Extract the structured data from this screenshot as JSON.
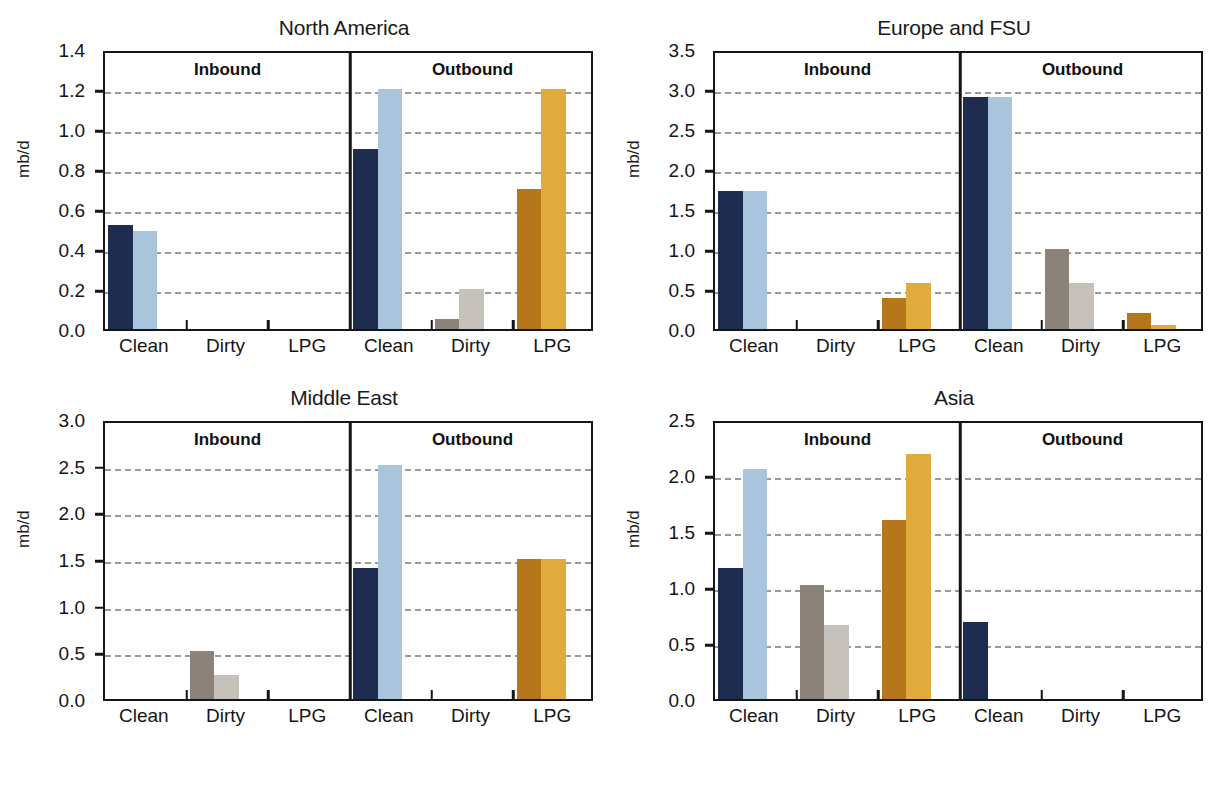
{
  "figure": {
    "cut_top_text": "",
    "cut_bottom_text": "",
    "ylabel": "mb/d",
    "section_labels": [
      "Inbound",
      "Outbound"
    ],
    "category_labels": [
      "Clean",
      "Dirty",
      "LPG"
    ],
    "colors": {
      "clean_dark": "#1e2c4f",
      "clean_light": "#a9c4dd",
      "dirty_dark": "#8b8279",
      "dirty_light": "#c6c2bb",
      "lpg_dark": "#b5761c",
      "lpg_light": "#e1aa3d",
      "frame": "#151515",
      "gridline": "#9a9a9a"
    }
  },
  "chart_data": [
    {
      "type": "bar",
      "title": "North America",
      "xlabel": "",
      "ylabel": "mb/d",
      "ylim": [
        0.0,
        1.4
      ],
      "yticks": [
        0.0,
        0.2,
        0.4,
        0.6,
        0.8,
        1.0,
        1.2,
        1.4
      ],
      "ytick_labels": [
        "0.0",
        "0.2",
        "0.4",
        "0.6",
        "0.8",
        "1.0",
        "1.2",
        "1.4"
      ],
      "gridlines": [
        0.2,
        0.4,
        0.6,
        0.8,
        1.0,
        1.2
      ],
      "grid": true,
      "legend": "none",
      "sections": [
        "Inbound",
        "Outbound"
      ],
      "categories": [
        "Clean",
        "Dirty",
        "LPG",
        "Clean",
        "Dirty",
        "LPG"
      ],
      "series": [
        {
          "name": "dark",
          "values": [
            0.52,
            0.0,
            0.0,
            0.9,
            0.05,
            0.7
          ]
        },
        {
          "name": "light",
          "values": [
            0.49,
            0.0,
            0.0,
            1.2,
            0.2,
            1.2
          ]
        }
      ]
    },
    {
      "type": "bar",
      "title": "Europe and FSU",
      "xlabel": "",
      "ylabel": "mb/d",
      "ylim": [
        0.0,
        3.5
      ],
      "yticks": [
        0.0,
        0.5,
        1.0,
        1.5,
        2.0,
        2.5,
        3.0,
        3.5
      ],
      "ytick_labels": [
        "0.0",
        "0.5",
        "1.0",
        "1.5",
        "2.0",
        "2.5",
        "3.0",
        "3.5"
      ],
      "gridlines": [
        0.5,
        1.0,
        1.5,
        2.0,
        2.5,
        3.0
      ],
      "grid": true,
      "legend": "none",
      "sections": [
        "Inbound",
        "Outbound"
      ],
      "categories": [
        "Clean",
        "Dirty",
        "LPG",
        "Clean",
        "Dirty",
        "LPG"
      ],
      "series": [
        {
          "name": "dark",
          "values": [
            1.72,
            0.0,
            0.39,
            2.9,
            1.0,
            0.2
          ]
        },
        {
          "name": "light",
          "values": [
            1.73,
            0.0,
            0.58,
            2.9,
            0.58,
            0.05
          ]
        }
      ]
    },
    {
      "type": "bar",
      "title": "Middle East",
      "xlabel": "",
      "ylabel": "mb/d",
      "ylim": [
        0.0,
        3.0
      ],
      "yticks": [
        0.0,
        0.5,
        1.0,
        1.5,
        2.0,
        2.5,
        3.0
      ],
      "ytick_labels": [
        "0.0",
        "0.5",
        "1.0",
        "1.5",
        "2.0",
        "2.5",
        "3.0"
      ],
      "gridlines": [
        0.5,
        1.0,
        1.5,
        2.0,
        2.5
      ],
      "grid": true,
      "legend": "none",
      "sections": [
        "Inbound",
        "Outbound"
      ],
      "categories": [
        "Clean",
        "Dirty",
        "LPG",
        "Clean",
        "Dirty",
        "LPG"
      ],
      "series": [
        {
          "name": "dark",
          "values": [
            0.0,
            0.51,
            0.0,
            1.4,
            0.0,
            1.5
          ]
        },
        {
          "name": "light",
          "values": [
            0.0,
            0.26,
            0.0,
            2.51,
            0.0,
            1.5
          ]
        }
      ]
    },
    {
      "type": "bar",
      "title": "Asia",
      "xlabel": "",
      "ylabel": "mb/d",
      "ylim": [
        0.0,
        2.5
      ],
      "yticks": [
        0.0,
        0.5,
        1.0,
        1.5,
        2.0,
        2.5
      ],
      "ytick_labels": [
        "0.0",
        "0.5",
        "1.0",
        "1.5",
        "2.0",
        "2.5"
      ],
      "gridlines": [
        0.5,
        1.0,
        1.5,
        2.0
      ],
      "grid": true,
      "legend": "none",
      "sections": [
        "Inbound",
        "Outbound"
      ],
      "categories": [
        "Clean",
        "Dirty",
        "LPG",
        "Clean",
        "Dirty",
        "LPG"
      ],
      "series": [
        {
          "name": "dark",
          "values": [
            1.17,
            1.02,
            1.6,
            0.69,
            0.0,
            0.0
          ]
        },
        {
          "name": "light",
          "values": [
            2.05,
            0.66,
            2.19,
            0.0,
            0.0,
            0.0
          ]
        }
      ]
    }
  ]
}
